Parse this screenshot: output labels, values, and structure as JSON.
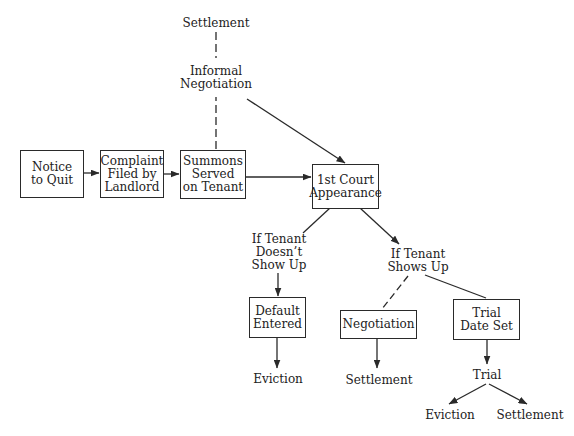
{
  "diagram": {
    "type": "flowchart",
    "title_cut_off": "",
    "nodes": {
      "notice_to_quit": "Notice\nto Quit",
      "complaint_filed": "Complaint\nFiled by\nLandlord",
      "summons_served": "Summons\nServed\non Tenant",
      "first_court_appearance": "1st Court\nAppearance",
      "default_entered": "Default\nEntered",
      "negotiation": "Negotiation",
      "trial_date_set": "Trial\nDate Set"
    },
    "labels": {
      "settlement_top": "Settlement",
      "informal_negotiation": "Informal\nNegotiation",
      "if_tenant_doesnt_show": "If Tenant\nDoesn’t\nShow Up",
      "if_tenant_shows": "If Tenant\nShows Up",
      "eviction_default": "Eviction",
      "settlement_negotiation": "Settlement",
      "trial": "Trial",
      "eviction_trial": "Eviction",
      "settlement_trial": "Settlement"
    },
    "edges": [
      {
        "from": "Notice to Quit",
        "to": "Complaint Filed by Landlord",
        "style": "solid-arrow"
      },
      {
        "from": "Complaint Filed by Landlord",
        "to": "Summons Served on Tenant",
        "style": "solid-arrow"
      },
      {
        "from": "Summons Served on Tenant",
        "to": "1st Court Appearance",
        "style": "solid-arrow"
      },
      {
        "from": "Summons Served on Tenant",
        "to": "Informal Negotiation",
        "style": "dashed"
      },
      {
        "from": "Informal Negotiation",
        "to": "Settlement",
        "style": "dashed"
      },
      {
        "from": "Informal Negotiation",
        "to": "1st Court Appearance",
        "style": "solid-arrow"
      },
      {
        "from": "1st Court Appearance",
        "to": "If Tenant Doesn't Show Up",
        "style": "solid"
      },
      {
        "from": "1st Court Appearance",
        "to": "If Tenant Shows Up",
        "style": "solid-arrow"
      },
      {
        "from": "If Tenant Doesn't Show Up",
        "to": "Default Entered",
        "style": "solid-arrow"
      },
      {
        "from": "Default Entered",
        "to": "Eviction",
        "style": "solid-arrow"
      },
      {
        "from": "If Tenant Shows Up",
        "to": "Negotiation",
        "style": "dashed"
      },
      {
        "from": "If Tenant Shows Up",
        "to": "Trial Date Set",
        "style": "solid"
      },
      {
        "from": "Negotiation",
        "to": "Settlement",
        "style": "solid-arrow"
      },
      {
        "from": "Trial Date Set",
        "to": "Trial",
        "style": "solid-arrow"
      },
      {
        "from": "Trial",
        "to": "Eviction",
        "style": "solid-arrow"
      },
      {
        "from": "Trial",
        "to": "Settlement",
        "style": "solid-arrow"
      }
    ],
    "colors": {
      "ink": "#2a2a2a",
      "background": "#ffffff"
    }
  }
}
